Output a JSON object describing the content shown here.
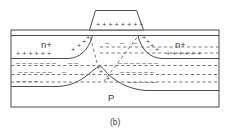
{
  "figure": {
    "caption": "(b)",
    "device_type": "MOSFET cross-section",
    "colors": {
      "line": "#4d4d4d",
      "dashed_line": "#6b6b6b",
      "text": "#3d3d3d",
      "charge": "#4a4a4a",
      "background": "#ffffff"
    },
    "gate": {
      "name": "gate-electrode",
      "charge_symbol": "+",
      "charge_row": "+ + + + + + + +",
      "charge_count": 8
    },
    "oxide": {
      "name": "gate-oxide-layer",
      "label": ""
    },
    "regions": {
      "source": {
        "label": "n+",
        "type": "n-plus"
      },
      "drain": {
        "label": "n+",
        "type": "n-plus"
      },
      "substrate": {
        "label": "P",
        "type": "p-substrate"
      }
    },
    "charges": {
      "positive_symbol": "+",
      "negative_symbol": "–",
      "source_plus_row": "+  +  +  +  +  +",
      "drain_plus_row": "+  +  +  +  +  +",
      "depletion_minus_symbol": "–"
    },
    "body_outline": {
      "left": 11,
      "right": 219,
      "top": 30,
      "bottom": 107
    }
  }
}
